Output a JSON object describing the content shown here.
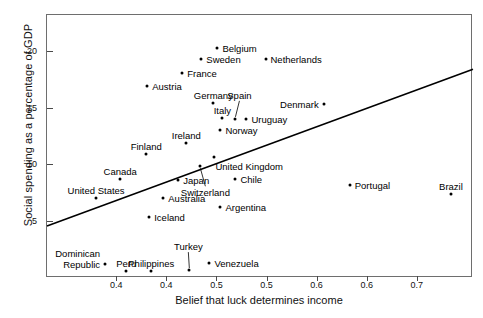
{
  "chart_data": {
    "type": "scatter",
    "title": "",
    "xlabel": "Belief that luck determines income",
    "ylabel": "Social spending as a percentage of GDP",
    "xlim": [
      0.33,
      0.755
    ],
    "ylim": [
      0.0,
      23.3
    ],
    "xticks": [
      0.35,
      0.4,
      0.45,
      0.5,
      0.55,
      0.6,
      0.65,
      0.7
    ],
    "xtick_labels": [
      "0.4",
      "0.4",
      "0.5",
      "0.5",
      "0.6",
      "0.6",
      "0.7"
    ],
    "xtick_values_shown": [
      0.4,
      0.45,
      0.5,
      0.55,
      0.6,
      0.65,
      0.7
    ],
    "yticks": [
      5,
      10,
      15,
      20
    ],
    "ytick_labels": [
      "5",
      "10",
      "15",
      "20"
    ],
    "grid": false,
    "legend": false,
    "trendline": {
      "type": "linear",
      "x_start": 0.33,
      "y_start": 4.6,
      "x_end": 0.755,
      "y_end": 18.5,
      "color": "#000000"
    },
    "points": [
      {
        "name": "Belgium",
        "x": 0.5,
        "y": 20.4,
        "label_pos": "right"
      },
      {
        "name": "Sweden",
        "x": 0.484,
        "y": 19.4,
        "label_pos": "right"
      },
      {
        "name": "Netherlands",
        "x": 0.548,
        "y": 19.4,
        "label_pos": "right"
      },
      {
        "name": "France",
        "x": 0.465,
        "y": 18.2,
        "label_pos": "right"
      },
      {
        "name": "Austria",
        "x": 0.43,
        "y": 17.0,
        "label_pos": "right"
      },
      {
        "name": "Germany",
        "x": 0.496,
        "y": 15.5,
        "label_pos": "above"
      },
      {
        "name": "Spain",
        "x": 0.518,
        "y": 14.1,
        "label_pos": "leader-above"
      },
      {
        "name": "Italy",
        "x": 0.505,
        "y": 14.2,
        "label_pos": "above"
      },
      {
        "name": "Denmark",
        "x": 0.606,
        "y": 15.4,
        "label_pos": "left"
      },
      {
        "name": "Uruguay",
        "x": 0.529,
        "y": 14.1,
        "label_pos": "right"
      },
      {
        "name": "Norway",
        "x": 0.503,
        "y": 13.1,
        "label_pos": "right"
      },
      {
        "name": "Ireland",
        "x": 0.469,
        "y": 12.0,
        "label_pos": "above"
      },
      {
        "name": "Finland",
        "x": 0.429,
        "y": 11.0,
        "label_pos": "above"
      },
      {
        "name": "United Kingdom",
        "x": 0.497,
        "y": 10.7,
        "label_pos": "below-right"
      },
      {
        "name": "Canada",
        "x": 0.403,
        "y": 8.8,
        "label_pos": "above"
      },
      {
        "name": "Chile",
        "x": 0.518,
        "y": 8.8,
        "label_pos": "right"
      },
      {
        "name": "United States",
        "x": 0.379,
        "y": 7.1,
        "label_pos": "above"
      },
      {
        "name": "Japan",
        "x": 0.461,
        "y": 8.7,
        "label_pos": "right"
      },
      {
        "name": "Switzerland",
        "x": 0.483,
        "y": 9.9,
        "label_pos": "leader-below"
      },
      {
        "name": "Australia",
        "x": 0.446,
        "y": 7.1,
        "label_pos": "right"
      },
      {
        "name": "Iceland",
        "x": 0.432,
        "y": 5.4,
        "label_pos": "right"
      },
      {
        "name": "Argentina",
        "x": 0.503,
        "y": 6.3,
        "label_pos": "right"
      },
      {
        "name": "Portugal",
        "x": 0.632,
        "y": 8.2,
        "label_pos": "right"
      },
      {
        "name": "Brazil",
        "x": 0.733,
        "y": 7.4,
        "label_pos": "above"
      },
      {
        "name": "Dominican Republic",
        "x": 0.388,
        "y": 1.2,
        "label_pos": "left-two-line"
      },
      {
        "name": "Peru",
        "x": 0.409,
        "y": 0.6,
        "label_pos": "above"
      },
      {
        "name": "Philippines",
        "x": 0.434,
        "y": 0.6,
        "label_pos": "above"
      },
      {
        "name": "Turkey",
        "x": 0.472,
        "y": 0.7,
        "label_pos": "leader-above"
      },
      {
        "name": "Venezuela",
        "x": 0.492,
        "y": 1.3,
        "label_pos": "right"
      }
    ]
  }
}
